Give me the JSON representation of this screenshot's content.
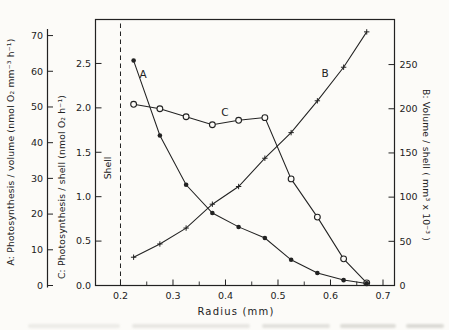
{
  "colors": {
    "ink": "#222222",
    "paper": "#fcfbf8"
  },
  "chart_data": {
    "type": "line",
    "title": "",
    "grid": false,
    "legend": "none",
    "x_values": [
      0.225,
      0.275,
      0.325,
      0.375,
      0.425,
      0.475,
      0.525,
      0.575,
      0.625,
      0.669
    ],
    "series": [
      {
        "name": "A",
        "axis": "left_A",
        "marker": "filled-circle",
        "values": [
          63,
          42,
          28.2,
          20.3,
          16.4,
          13.3,
          7.2,
          3.5,
          1.5,
          0.6
        ]
      },
      {
        "name": "C",
        "axis": "left_C",
        "marker": "open-circle",
        "values": [
          2.04,
          1.99,
          1.9,
          1.81,
          1.86,
          1.89,
          1.2,
          0.77,
          0.3,
          0.03
        ]
      },
      {
        "name": "B",
        "axis": "right_B",
        "marker": "plus",
        "values": [
          32,
          47,
          65,
          92,
          112,
          144,
          173,
          209,
          247,
          287
        ]
      }
    ],
    "axes": {
      "x": {
        "label": "Radius (mm)",
        "ticks": [
          "0.2",
          "0.3",
          "0.4",
          "0.5",
          "0.6",
          "0.7"
        ],
        "minor_ticks": [
          0.25,
          0.35,
          0.45,
          0.55,
          0.65
        ],
        "range": [
          0.1524,
          0.7219
        ]
      },
      "left_A": {
        "label": "A: Photosynthesis / volume (nmol O₂ mm⁻³ h⁻¹)",
        "ticks": [
          "0",
          "10",
          "20",
          "30",
          "40",
          "50",
          "60",
          "70"
        ],
        "range": [
          0,
          74.5
        ]
      },
      "left_C": {
        "label": "C: Photosynthesis / shell (nmol O₂ h⁻¹)",
        "ticks": [
          "0.0",
          "0.5",
          "1.0",
          "1.5",
          "2.0",
          "2.5"
        ],
        "range": [
          0,
          2.995
        ]
      },
      "right_B": {
        "label": "B: Volume / shell ( mm³ x 10⁻³ )",
        "ticks": [
          "0",
          "50",
          "100",
          "150",
          "200",
          "250"
        ],
        "range": [
          0,
          301
        ]
      }
    },
    "reference_line": {
      "x": 0.2,
      "label": "Shell",
      "style": "dashed"
    },
    "series_letter_labels": [
      {
        "text": "A",
        "x": 143,
        "y": 74
      },
      {
        "text": "B",
        "x": 325,
        "y": 73
      },
      {
        "text": "C",
        "x": 225,
        "y": 112
      }
    ]
  }
}
